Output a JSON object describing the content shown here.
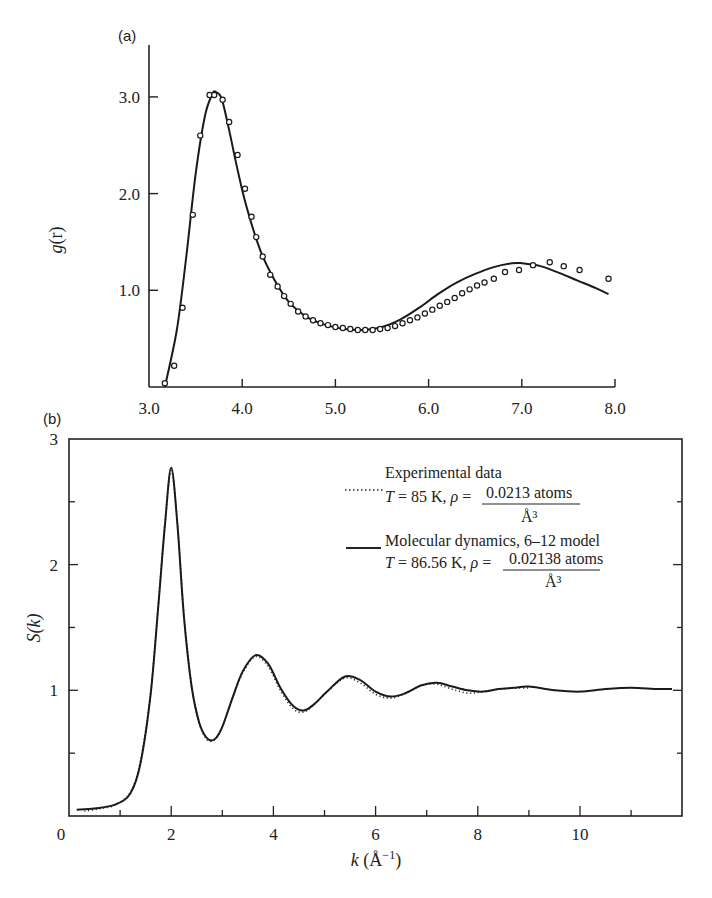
{
  "chart_data": [
    {
      "panel": "(a)",
      "type": "line",
      "title": "",
      "xlabel": "",
      "ylabel": "g(r)",
      "xlim": [
        3.0,
        8.0
      ],
      "ylim": [
        0,
        3.5
      ],
      "x_ticks": [
        "3.0",
        "4.0",
        "5.0",
        "6.0",
        "7.0",
        "8.0"
      ],
      "y_ticks": [
        "1.0",
        "2.0",
        "3.0"
      ],
      "grid": false,
      "series": [
        {
          "name": "Theory (solid curve)",
          "style": "solid",
          "x": [
            3.17,
            3.3,
            3.4,
            3.5,
            3.6,
            3.68,
            3.72,
            3.78,
            3.85,
            3.95,
            4.05,
            4.2,
            4.35,
            4.5,
            4.7,
            4.9,
            5.1,
            5.3,
            5.5,
            5.7,
            5.9,
            6.1,
            6.3,
            6.5,
            6.7,
            6.9,
            7.0,
            7.2,
            7.4,
            7.6,
            7.8,
            7.93
          ],
          "values": [
            0.0,
            0.6,
            1.35,
            2.2,
            2.8,
            3.03,
            3.05,
            2.98,
            2.7,
            2.25,
            1.85,
            1.4,
            1.1,
            0.88,
            0.72,
            0.64,
            0.6,
            0.59,
            0.62,
            0.7,
            0.82,
            0.96,
            1.08,
            1.17,
            1.24,
            1.28,
            1.28,
            1.25,
            1.18,
            1.1,
            1.02,
            0.96
          ]
        },
        {
          "name": "Experimental (open circles)",
          "style": "circles",
          "x": [
            3.17,
            3.27,
            3.36,
            3.47,
            3.55,
            3.65,
            3.7,
            3.79,
            3.86,
            3.95,
            4.03,
            4.1,
            4.15,
            4.22,
            4.3,
            4.38,
            4.45,
            4.52,
            4.6,
            4.68,
            4.76,
            4.84,
            4.92,
            5.0,
            5.08,
            5.16,
            5.24,
            5.32,
            5.4,
            5.48,
            5.56,
            5.64,
            5.72,
            5.8,
            5.88,
            5.96,
            6.04,
            6.12,
            6.2,
            6.28,
            6.36,
            6.44,
            6.52,
            6.6,
            6.7,
            6.82,
            6.97,
            7.12,
            7.3,
            7.45,
            7.62,
            7.93
          ],
          "values": [
            0.04,
            0.22,
            0.82,
            1.78,
            2.6,
            3.02,
            3.02,
            2.97,
            2.74,
            2.4,
            2.05,
            1.76,
            1.55,
            1.35,
            1.16,
            1.04,
            0.94,
            0.86,
            0.78,
            0.73,
            0.69,
            0.66,
            0.64,
            0.62,
            0.61,
            0.6,
            0.59,
            0.59,
            0.59,
            0.6,
            0.61,
            0.63,
            0.66,
            0.69,
            0.72,
            0.76,
            0.8,
            0.84,
            0.88,
            0.92,
            0.97,
            1.01,
            1.05,
            1.08,
            1.12,
            1.19,
            1.21,
            1.26,
            1.29,
            1.25,
            1.21,
            1.12,
            0.96
          ]
        }
      ]
    },
    {
      "panel": "(b)",
      "type": "line",
      "title": "",
      "xlabel": "k (Å⁻¹)",
      "ylabel": "S(k)",
      "xlim": [
        0,
        12
      ],
      "ylim": [
        0,
        3
      ],
      "x_ticks": [
        "0",
        "2",
        "4",
        "6",
        "8",
        "10"
      ],
      "y_ticks": [
        "1",
        "2",
        "3"
      ],
      "grid": false,
      "legend_position": "upper right",
      "series": [
        {
          "name": "Experimental data",
          "legend_line2": "T = 85 K, ρ = 0.0213 atoms / Å³",
          "style": "dotted",
          "x": [
            0.3,
            0.6,
            0.9,
            1.2,
            1.4,
            1.6,
            1.75,
            1.88,
            2.0,
            2.12,
            2.25,
            2.4,
            2.55,
            2.7,
            2.85,
            3.0,
            3.2,
            3.4,
            3.65,
            3.9,
            4.15,
            4.4,
            4.6,
            4.8,
            5.05,
            5.4,
            5.7,
            6.0,
            6.3,
            6.6,
            6.9,
            7.2,
            7.5,
            7.8,
            8.1,
            8.4,
            8.7,
            9.0
          ],
          "values": [
            0.05,
            0.07,
            0.1,
            0.2,
            0.45,
            1.0,
            1.7,
            2.35,
            2.76,
            2.35,
            1.6,
            1.05,
            0.75,
            0.62,
            0.62,
            0.72,
            0.95,
            1.15,
            1.28,
            1.2,
            1.0,
            0.86,
            0.84,
            0.9,
            1.0,
            1.11,
            1.07,
            0.98,
            0.95,
            0.99,
            1.05,
            1.06,
            1.02,
            0.99,
            1.0,
            1.02,
            1.03,
            1.03
          ]
        },
        {
          "name": "Molecular dynamics, 6–12 model",
          "legend_line2": "T = 86.56 K, ρ = 0.02138 atoms / Å³",
          "style": "solid",
          "x": [
            0.15,
            0.5,
            0.9,
            1.2,
            1.4,
            1.6,
            1.75,
            1.88,
            2.0,
            2.12,
            2.25,
            2.4,
            2.55,
            2.7,
            2.85,
            3.0,
            3.2,
            3.4,
            3.65,
            3.9,
            4.15,
            4.4,
            4.6,
            4.8,
            5.05,
            5.4,
            5.7,
            6.0,
            6.3,
            6.6,
            6.9,
            7.2,
            7.5,
            7.8,
            8.1,
            8.4,
            8.7,
            9.0,
            9.5,
            10.0,
            10.5,
            11.0,
            11.5,
            11.8
          ],
          "values": [
            0.05,
            0.06,
            0.09,
            0.18,
            0.42,
            0.98,
            1.68,
            2.33,
            2.77,
            2.33,
            1.58,
            1.03,
            0.74,
            0.62,
            0.61,
            0.71,
            0.94,
            1.15,
            1.28,
            1.21,
            1.01,
            0.87,
            0.84,
            0.89,
            0.99,
            1.11,
            1.08,
            0.99,
            0.95,
            0.98,
            1.04,
            1.06,
            1.03,
            1.0,
            0.99,
            1.01,
            1.02,
            1.03,
            1.0,
            0.99,
            1.01,
            1.02,
            1.01,
            1.01
          ]
        }
      ]
    }
  ],
  "panels": {
    "a": {
      "label": "(a)",
      "ylabel_main": "g",
      "ylabel_paren": "(r)",
      "x_tick_labels": [
        "3.0",
        "4.0",
        "5.0",
        "6.0",
        "7.0",
        "8.0"
      ],
      "y_tick_labels": [
        "1.0",
        "2.0",
        "3.0"
      ]
    },
    "b": {
      "label": "(b)",
      "ylabel": "S(k)",
      "xlabel": "k (Å⁻¹)",
      "x_tick_labels": [
        "0",
        "2",
        "4",
        "6",
        "8",
        "10"
      ],
      "y_tick_labels": [
        "1",
        "2",
        "3"
      ],
      "legend": {
        "exp_title": "Experimental data",
        "exp_params": "T = 85 K, ρ =",
        "exp_num": "0.0213 atoms",
        "exp_den": "Å³",
        "md_title": "Molecular dynamics, 6–12 model",
        "md_params": "T = 86.56 K, ρ =",
        "md_num": "0.02138 atoms",
        "md_den": "Å³"
      }
    }
  }
}
